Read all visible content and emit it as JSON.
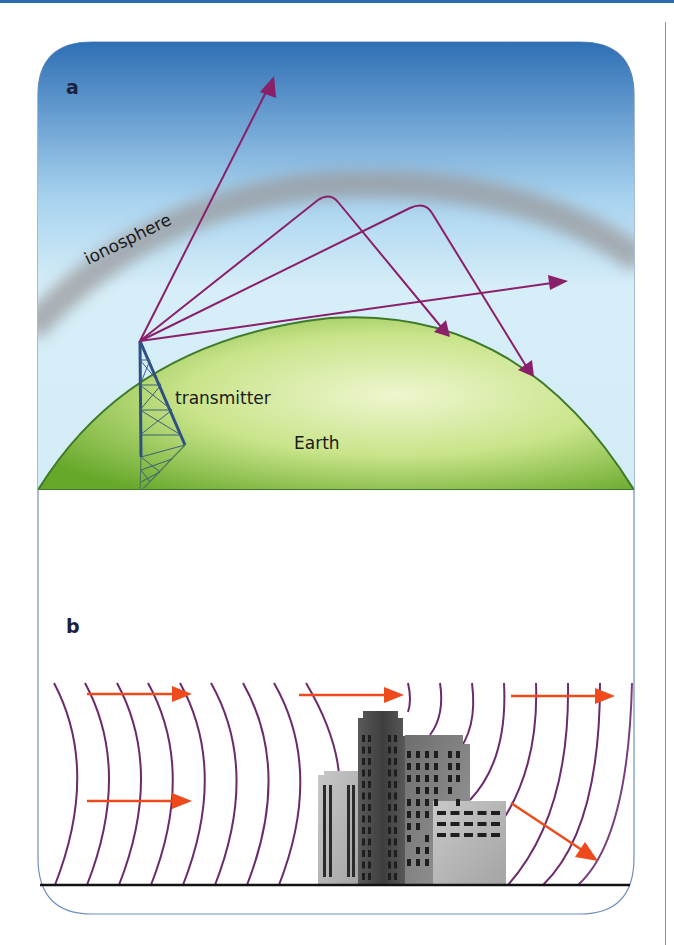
{
  "figure": {
    "panel_a": {
      "label": "a",
      "labels": {
        "ionosphere": "ionosphere",
        "transmitter": "transmitter",
        "earth": "Earth"
      },
      "colors": {
        "sky_top": "#2f6fb5",
        "sky_bottom": "#d6eef8",
        "ionosphere_band": "#9a9a9c",
        "earth_dark": "#6fae2c",
        "earth_light": "#e3f0b8",
        "ray": "#8a1f6a",
        "tower": "#2d4f86"
      },
      "rays": [
        {
          "name": "escaping-ray"
        },
        {
          "name": "reflected-ray-1"
        },
        {
          "name": "reflected-ray-2"
        },
        {
          "name": "tangent-ray"
        }
      ]
    },
    "panel_b": {
      "label": "b",
      "colors": {
        "wavefront": "#6b2a6b",
        "arrow": "#ee4a1c",
        "ground": "#111111",
        "building_dark": "#4a4a4a",
        "building_light": "#b8b8b8"
      },
      "arrows": [
        {
          "name": "arrow-top-left"
        },
        {
          "name": "arrow-bottom-left"
        },
        {
          "name": "arrow-top-middle"
        },
        {
          "name": "arrow-top-right"
        },
        {
          "name": "arrow-diffracted"
        }
      ]
    },
    "frame_color": "#6e8fbf"
  }
}
